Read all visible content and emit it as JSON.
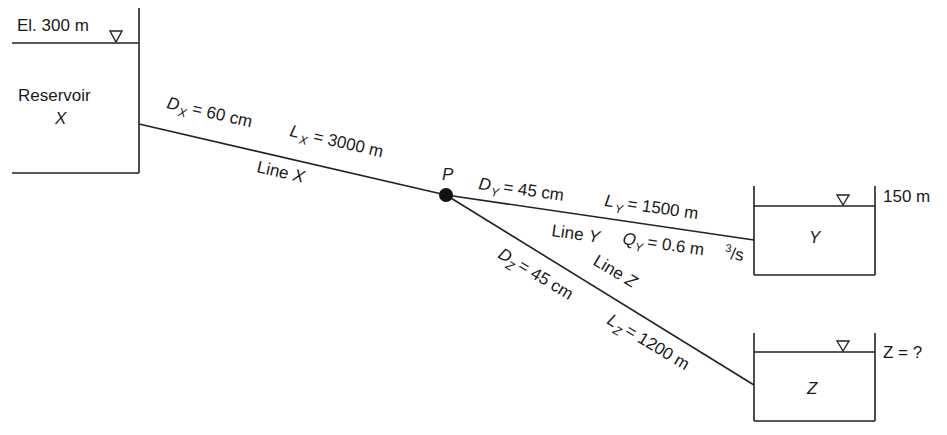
{
  "diagram": {
    "type": "three-reservoir pipe network",
    "junction": {
      "label": "P"
    },
    "reservoir_x": {
      "name": "Reservoir",
      "letter": "X",
      "elevation_label": "El. 300 m"
    },
    "reservoir_y": {
      "letter": "Y",
      "elevation_label": "150 m"
    },
    "reservoir_z": {
      "letter": "Z",
      "elevation_label": "Z = ?"
    },
    "line_x": {
      "name": "Line X",
      "name_text": "Line ",
      "name_letter": "X",
      "diameter": {
        "symbol": "D",
        "subscript": "X",
        "value": "= 60 cm"
      },
      "length": {
        "symbol": "L",
        "subscript": "X",
        "value": "= 3000 m"
      }
    },
    "line_y": {
      "name": "Line Y",
      "name_text": "Line ",
      "name_letter": "Y",
      "diameter": {
        "symbol": "D",
        "subscript": "Y",
        "value": "= 45 cm"
      },
      "length": {
        "symbol": "L",
        "subscript": "Y",
        "value": "= 1500 m"
      },
      "flow": {
        "symbol": "Q",
        "subscript": "Y",
        "value": "= 0.6 m",
        "sup": "3",
        "unit_tail": "/s"
      }
    },
    "line_z": {
      "name": "Line Z",
      "name_text": "Line ",
      "name_letter": "Z",
      "diameter": {
        "symbol": "D",
        "subscript": "Z",
        "value": "= 45 cm"
      },
      "length": {
        "symbol": "L",
        "subscript": "Z",
        "value": "= 1200 m"
      }
    },
    "water_surface_symbol": "inverted-triangle"
  }
}
